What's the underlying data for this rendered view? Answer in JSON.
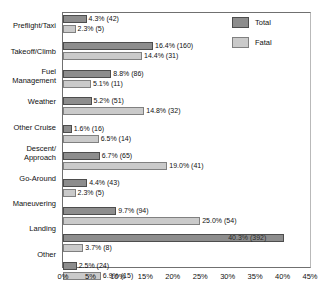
{
  "chart_data": {
    "type": "bar",
    "orientation": "horizontal",
    "title": "",
    "xlabel": "",
    "ylabel": "",
    "xlim": [
      0,
      45
    ],
    "xticks": [
      "0%",
      "5%",
      "10%",
      "15%",
      "20%",
      "25%",
      "30%",
      "35%",
      "40%",
      "45%"
    ],
    "xtick_values": [
      0,
      5,
      10,
      15,
      20,
      25,
      30,
      35,
      40,
      45
    ],
    "grid": false,
    "legend_position": "top-right",
    "categories": [
      "Preflight/Taxi",
      "Takeoff/Climb",
      "Fuel Management",
      "Weather",
      "Other Cruise",
      "Descent/ Approach",
      "Go-Around",
      "Maneuvering",
      "Landing",
      "Other"
    ],
    "series": [
      {
        "name": "Total",
        "color": "#8d8d8d",
        "values": [
          4.3,
          16.4,
          8.8,
          5.2,
          1.6,
          6.7,
          4.4,
          9.7,
          40.3,
          2.5
        ],
        "counts": [
          42,
          160,
          86,
          51,
          16,
          65,
          43,
          94,
          392,
          24
        ],
        "labels": [
          "4.3% (42)",
          "16.4% (160)",
          "8.8% (86)",
          "5.2% (51)",
          "1.6% (16)",
          "6.7% (65)",
          "4.4% (43)",
          "9.7% (94)",
          "40.3% (392)",
          "2.5% (24)"
        ]
      },
      {
        "name": "Fatal",
        "color": "#cacaca",
        "values": [
          2.3,
          14.4,
          5.1,
          14.8,
          6.5,
          19.0,
          2.3,
          25.0,
          3.7,
          6.9
        ],
        "counts": [
          5,
          31,
          11,
          32,
          14,
          41,
          5,
          54,
          8,
          15
        ],
        "labels": [
          "2.3% (5)",
          "14.4% (31)",
          "5.1% (11)",
          "14.8% (32)",
          "6.5% (14)",
          "19.0% (41)",
          "2.3% (5)",
          "25.0% (54)",
          "3.7% (8)",
          "6.9% (15)"
        ]
      }
    ]
  },
  "legend": {
    "items": [
      {
        "label": "Total",
        "color": "#8d8d8d"
      },
      {
        "label": "Fatal",
        "color": "#cacaca"
      }
    ]
  },
  "y_categories": [
    {
      "lines": [
        "Preflight/Taxi"
      ]
    },
    {
      "lines": [
        "Takeoff/Climb"
      ]
    },
    {
      "lines": [
        "Fuel",
        "Management"
      ]
    },
    {
      "lines": [
        "Weather"
      ]
    },
    {
      "lines": [
        "Other Cruise"
      ]
    },
    {
      "lines": [
        "Descent/",
        "Approach"
      ]
    },
    {
      "lines": [
        "Go-Around"
      ]
    },
    {
      "lines": [
        "Maneuvering"
      ]
    },
    {
      "lines": [
        "Landing"
      ]
    },
    {
      "lines": [
        "Other"
      ]
    }
  ]
}
